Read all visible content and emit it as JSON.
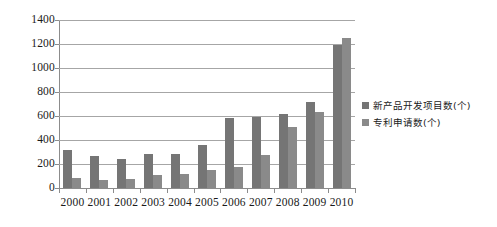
{
  "chart_data": {
    "type": "bar",
    "title": "",
    "subtitle": "",
    "xlabel": "",
    "ylabel": "",
    "grid": true,
    "legend_position": "right",
    "ylim": [
      0,
      1400
    ],
    "yticks": [
      0,
      200,
      400,
      600,
      800,
      1000,
      1200,
      1400
    ],
    "ytick_labels": [
      "0",
      "200",
      "400",
      "600",
      "800",
      "1000",
      "1200",
      "1400"
    ],
    "categories": [
      "2000",
      "2001",
      "2002",
      "2003",
      "2004",
      "2005",
      "2006",
      "2007",
      "2008",
      "2009",
      "2010"
    ],
    "series": [
      {
        "name": "新产品开发项目数(个)",
        "color": "#757575",
        "values": [
          320,
          270,
          240,
          280,
          285,
          355,
          580,
          590,
          620,
          720,
          1190
        ]
      },
      {
        "name": "专利申请数(个)",
        "color": "#8a8a8a",
        "values": [
          85,
          70,
          75,
          110,
          115,
          150,
          175,
          275,
          510,
          635,
          1250
        ]
      }
    ]
  },
  "legend": {
    "items": [
      {
        "label": "新产品开发项目数(个)",
        "marker": "square-marker",
        "color": "#757575"
      },
      {
        "label": "专利申请数(个)",
        "marker": "square-marker",
        "color": "#8a8a8a"
      }
    ]
  },
  "colors": {
    "background": "#ffffff",
    "gridline": "#a6a6a6",
    "axis": "#8c8c8c",
    "text": "#1a1a1a"
  }
}
